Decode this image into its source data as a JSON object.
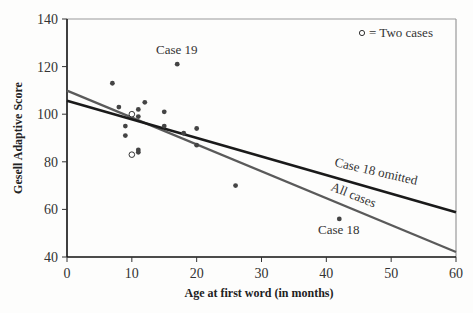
{
  "chart_data": {
    "type": "scatter",
    "title": "",
    "xlabel": "Age at first word (in months)",
    "ylabel": "Gesell Adaptive Score",
    "xlim": [
      0,
      60
    ],
    "ylim": [
      40,
      140
    ],
    "xticks": [
      0,
      10,
      20,
      30,
      40,
      50,
      60
    ],
    "yticks": [
      40,
      60,
      80,
      100,
      120,
      140
    ],
    "grid": false,
    "legend": {
      "position": "top-right",
      "text": "= Two cases",
      "marker": "open-circle"
    },
    "points": [
      {
        "x": 7,
        "y": 113
      },
      {
        "x": 8,
        "y": 103
      },
      {
        "x": 9,
        "y": 95
      },
      {
        "x": 9,
        "y": 91
      },
      {
        "x": 10,
        "y": 100,
        "count": 2
      },
      {
        "x": 10,
        "y": 83,
        "count": 2
      },
      {
        "x": 11,
        "y": 102
      },
      {
        "x": 11,
        "y": 99
      },
      {
        "x": 11,
        "y": 85
      },
      {
        "x": 11,
        "y": 84
      },
      {
        "x": 12,
        "y": 105
      },
      {
        "x": 15,
        "y": 101
      },
      {
        "x": 15,
        "y": 95
      },
      {
        "x": 17,
        "y": 121,
        "label": "Case 19"
      },
      {
        "x": 18,
        "y": 92
      },
      {
        "x": 20,
        "y": 94
      },
      {
        "x": 20,
        "y": 87
      },
      {
        "x": 26,
        "y": 70
      },
      {
        "x": 42,
        "y": 56,
        "label": "Case 18"
      }
    ],
    "series": [
      {
        "name": "All cases",
        "type": "line",
        "intercept": 109.9,
        "slope": -1.13,
        "color": "#5a5a5a"
      },
      {
        "name": "Case 18 omitted",
        "type": "line",
        "intercept": 105.6,
        "slope": -0.78,
        "color": "#1a1a1a"
      }
    ],
    "annotations": [
      "Case 19",
      "Case 18",
      "Case 18 omitted",
      "All cases"
    ]
  }
}
